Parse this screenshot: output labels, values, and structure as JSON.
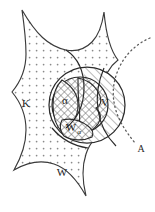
{
  "figure": {
    "type": "set-theoretic-diagram",
    "background_color": "#ffffff",
    "stroke_color": "#2b2b2b",
    "regions": [
      {
        "id": "K",
        "label": "K",
        "fill_pattern": "dots",
        "label_x": 26,
        "label_y": 107,
        "description": "large stippled star-shaped region on the left"
      },
      {
        "id": "W",
        "label": "W",
        "fill_pattern": "dots",
        "label_x": 62,
        "label_y": 176,
        "description": "stippled region at the bottom, same pattern as K"
      },
      {
        "id": "V",
        "label": "V",
        "fill_pattern": "diagonal-hatch",
        "label_x": 105,
        "label_y": 106,
        "description": "diagonally hatched lens at the right of the big disk"
      },
      {
        "id": "alpha",
        "label": "α",
        "fill_pattern": "cross-hatch",
        "label_x": 65,
        "label_y": 104,
        "description": "cross-hatched inner lens, labelled alpha"
      },
      {
        "id": "W-alpha",
        "label": "W",
        "sublabel": "α",
        "fill_pattern": "cross-hatch",
        "label_x": 71,
        "label_y": 131,
        "sublabel_x": 81,
        "sublabel_y": 134,
        "description": "lower cross-hatched lobe labelled W subscript alpha"
      }
    ],
    "curves": [
      {
        "id": "A",
        "label": "A",
        "style": "dotted",
        "label_x": 141,
        "label_y": 152,
        "description": "dotted arc sweeping from upper right down to lower right, labelled A"
      }
    ],
    "circles": [
      {
        "id": "outer-disk",
        "cx": 87,
        "cy": 105,
        "r": 38,
        "style": "solid"
      },
      {
        "id": "inner-disk",
        "cx": 80,
        "cy": 105,
        "r": 28,
        "style": "solid"
      }
    ]
  }
}
